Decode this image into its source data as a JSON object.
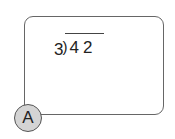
{
  "problem": {
    "divisor": "3",
    "bracket": ")",
    "dividend": "42"
  },
  "answer_choice": {
    "label": "A"
  }
}
